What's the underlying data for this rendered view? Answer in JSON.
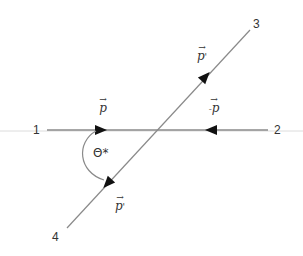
{
  "diagram": {
    "type": "scattering-diagram",
    "colors": {
      "line": "#8a8a8a",
      "arrow": "#111111",
      "text": "#333333",
      "baseline": "#d0d0d0"
    },
    "particles": [
      {
        "id": "1",
        "label": "1"
      },
      {
        "id": "2",
        "label": "2"
      },
      {
        "id": "3",
        "label": "3"
      },
      {
        "id": "4",
        "label": "4"
      }
    ],
    "momenta": [
      {
        "name": "incoming-1",
        "vector_arrow": "→",
        "symbol": "p",
        "prefix": "",
        "suffix": ""
      },
      {
        "name": "incoming-2",
        "vector_arrow": "→",
        "symbol": "p",
        "prefix": "-",
        "suffix": ""
      },
      {
        "name": "outgoing-3",
        "vector_arrow": "→",
        "symbol": "p",
        "prefix": "",
        "suffix": "'"
      },
      {
        "name": "outgoing-4",
        "vector_arrow": "→",
        "symbol": "p",
        "prefix": "",
        "suffix": "'"
      }
    ],
    "angle_label": "Θ*"
  }
}
